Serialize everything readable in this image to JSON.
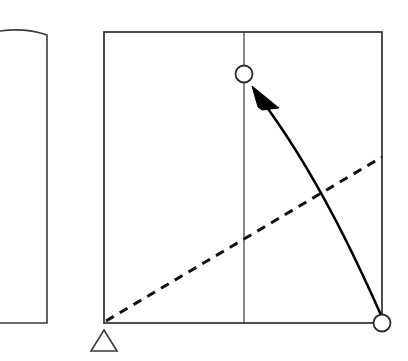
{
  "figure": {
    "background_color": "#ffffff",
    "stroke_color": "#3a3a3a",
    "accent_color": "#000000",
    "width": 408,
    "height": 361
  },
  "shapes": {
    "left_panel": {
      "name": "left-panel",
      "description": "partial rectangular panel clipped by left image edge, curved top edge",
      "points": "-40,42 16,24 47,35 47,323 -40,323",
      "top_curve": "M -40 42 Q 10 22 47 35",
      "right_edge_x": 47,
      "bottom_y": 323,
      "stroke_width": 1.6,
      "fill": "#ffffff"
    },
    "main_square": {
      "name": "main-square",
      "x": 104,
      "y": 32,
      "width": 278,
      "height": 291,
      "stroke_width": 1.8,
      "fill": "#ffffff"
    },
    "center_vertical_line": {
      "name": "center-vertical-line",
      "x": 244,
      "y_top": 32,
      "y_bottom": 323,
      "stroke_width": 1.2
    },
    "dashed_diagonal": {
      "name": "dashed-diagonal-line",
      "x1": 106,
      "y1": 321,
      "x2": 382,
      "y2": 157,
      "stroke_width": 3.0,
      "dash_pattern": "9 7"
    },
    "curved_arrow": {
      "name": "curved-motion-arrow",
      "path": "M 381 315 C 360 268 318 175 260 98",
      "stroke_width": 2.6,
      "arrowhead_points": "252,86 279,108 262,110 258,107",
      "direction": "from bottom-right pivot circle to upper circle"
    },
    "circle_top": {
      "name": "joint-circle-top",
      "cx": 244,
      "cy": 74,
      "r": 8.5,
      "stroke_width": 1.8,
      "fill": "#ffffff"
    },
    "circle_bottom_right": {
      "name": "joint-circle-bottom-right",
      "cx": 382,
      "cy": 323,
      "r": 8.5,
      "stroke_width": 1.8,
      "fill": "#ffffff"
    },
    "support_triangle": {
      "name": "pivot-support-triangle",
      "points": "104,330 117,351 91,351",
      "stroke_width": 1.6,
      "fill": "#ffffff",
      "description": "open triangle support marker below the bottom-left corner"
    }
  },
  "labels": {
    "left_panel_label": "",
    "square_label": "",
    "top_joint_label": "",
    "bottom_joint_label": "",
    "support_label": ""
  }
}
